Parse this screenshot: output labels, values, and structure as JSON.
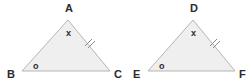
{
  "diagram": {
    "type": "congruent-triangles",
    "background_color": "#ffffff",
    "fill_color": "#efefef",
    "stroke_color": "#b5b5b5",
    "tick_color": "#8a8a8a",
    "label_color": "#2b2b2b",
    "triangles": [
      {
        "name": "triangle-abc",
        "vertices": {
          "apex": {
            "label": "A",
            "x": 68,
            "y": 20,
            "label_x": 65,
            "label_y": 12
          },
          "bottom_left": {
            "label": "B",
            "x": 22,
            "y": 71,
            "label_x": 7,
            "label_y": 78
          },
          "bottom_right": {
            "label": "C",
            "x": 110,
            "y": 71,
            "label_x": 114,
            "label_y": 78
          }
        },
        "angle_marks": [
          {
            "name": "apex-angle-x",
            "label": "x",
            "x": 66,
            "y": 36
          },
          {
            "name": "bottom-left-angle-o",
            "label": "o",
            "x": 33,
            "y": 69
          }
        ],
        "side_ticks": [
          {
            "name": "double-tick-ac",
            "count": 2,
            "side": "A-C",
            "x": 88,
            "y": 43
          }
        ]
      },
      {
        "name": "triangle-def",
        "vertices": {
          "apex": {
            "label": "D",
            "x": 193,
            "y": 20,
            "label_x": 190,
            "label_y": 12
          },
          "bottom_left": {
            "label": "E",
            "x": 148,
            "y": 71,
            "label_x": 133,
            "label_y": 78
          },
          "bottom_right": {
            "label": "F",
            "x": 235,
            "y": 71,
            "label_x": 239,
            "label_y": 78
          }
        },
        "angle_marks": [
          {
            "name": "apex-angle-x",
            "label": "x",
            "x": 191,
            "y": 36
          },
          {
            "name": "bottom-left-angle-o",
            "label": "o",
            "x": 159,
            "y": 69
          }
        ],
        "side_ticks": [
          {
            "name": "double-tick-df",
            "count": 2,
            "side": "D-F",
            "x": 213,
            "y": 43
          }
        ]
      }
    ]
  }
}
